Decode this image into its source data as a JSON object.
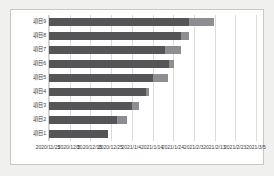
{
  "chart_data": {
    "type": "bar",
    "subtype": "horizontal-stacked",
    "title": "",
    "xlabel": "",
    "ylabel": "",
    "orientation": "horizontal",
    "grid": true,
    "legend": "none",
    "categories": [
      "項目9",
      "項目8",
      "項目7",
      "項目6",
      "項目5",
      "項目4",
      "項目3",
      "項目2",
      "項目1"
    ],
    "xtick_labels": [
      "2020/11/25",
      "2020/12/5",
      "2020/12/15",
      "2020/12/25",
      "2021/1/4",
      "2021/1/14",
      "2021/1/24",
      "2021/2/3",
      "2021/2/13",
      "2021/2/23",
      "2021/3/5"
    ],
    "xlim": [
      0,
      100
    ],
    "series": [
      {
        "name": "開始からの期間",
        "color": "#555558",
        "values": [
          67.5,
          64.0,
          56.0,
          58.0,
          50.0,
          47.0,
          40.0,
          33.0,
          28.5
        ]
      },
      {
        "name": "残り期間",
        "color": "#8e8e92",
        "values": [
          12.0,
          3.5,
          8.0,
          2.5,
          7.5,
          1.5,
          3.5,
          4.5,
          0.0
        ]
      }
    ]
  }
}
